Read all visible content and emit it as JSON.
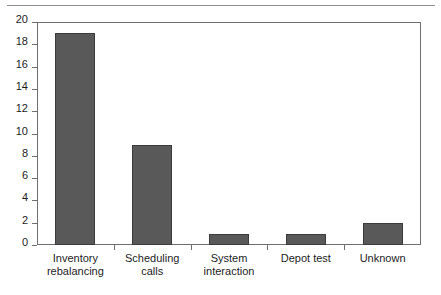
{
  "chart_data": {
    "type": "bar",
    "title": "",
    "subtitle": "",
    "xlabel": "",
    "ylabel": "",
    "categories": [
      "Inventory rebalancing",
      "Scheduling calls",
      "System interaction",
      "Depot test",
      "Unknown"
    ],
    "category_lines": [
      [
        "Inventory",
        "rebalancing"
      ],
      [
        "Scheduling",
        "calls"
      ],
      [
        "System",
        "interaction"
      ],
      [
        "Depot test"
      ],
      [
        "Unknown"
      ]
    ],
    "values": [
      19,
      9,
      1,
      1,
      2
    ],
    "ylim": [
      0,
      20
    ],
    "ytick_values": [
      0,
      2,
      4,
      6,
      8,
      10,
      12,
      14,
      16,
      18,
      20
    ],
    "ytick_labels": [
      "0",
      "2",
      "4",
      "6",
      "8",
      "10",
      "12",
      "14",
      "16",
      "18",
      "20"
    ],
    "grid": false,
    "legend": false,
    "legend_position": "none",
    "colors": {
      "bar_fill": "#595959",
      "bar_edge": "#3b3b3b",
      "axis": "#6f6f6f",
      "rule": "#8e8e8e",
      "text": "#1d1d1d",
      "background": "#ffffff"
    }
  }
}
